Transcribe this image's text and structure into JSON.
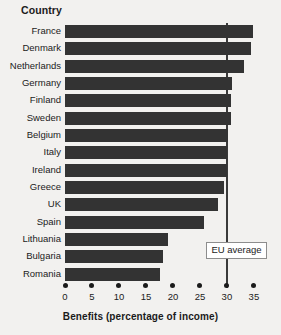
{
  "header": {
    "category_column_label": "Country"
  },
  "annotation": {
    "eu_average_label": "EU average"
  },
  "colors": {
    "bar": "#333333",
    "background": "#f2f1ef",
    "text": "#1b1b1b",
    "reference_line": "#3a3a3a",
    "callout_border": "#8d8d8d"
  },
  "chart_data": {
    "type": "bar",
    "orientation": "horizontal",
    "title": "",
    "subtitle": "",
    "xlabel": "Benefits (percentage of income)",
    "ylabel": "Country",
    "xlim": [
      0,
      36.5
    ],
    "xticks": [
      0,
      5,
      10,
      15,
      20,
      25,
      30,
      35
    ],
    "xtick_labels": [
      "0",
      "5",
      "10",
      "15",
      "20",
      "25",
      "30",
      "35"
    ],
    "grid": false,
    "legend": false,
    "categories": [
      "France",
      "Denmark",
      "Netherlands",
      "Germany",
      "Finland",
      "Sweden",
      "Belgium",
      "Italy",
      "Ireland",
      "Greece",
      "UK",
      "Spain",
      "Lithuania",
      "Bulgaria",
      "Romania"
    ],
    "values": [
      34.8,
      34.5,
      33.2,
      30.9,
      30.8,
      30.7,
      30.2,
      30.1,
      30.0,
      29.4,
      28.3,
      25.7,
      19.1,
      18.1,
      17.6
    ],
    "annotations": [
      {
        "label": "EU average",
        "type": "vertical-reference-line",
        "value": 30.0
      }
    ]
  }
}
